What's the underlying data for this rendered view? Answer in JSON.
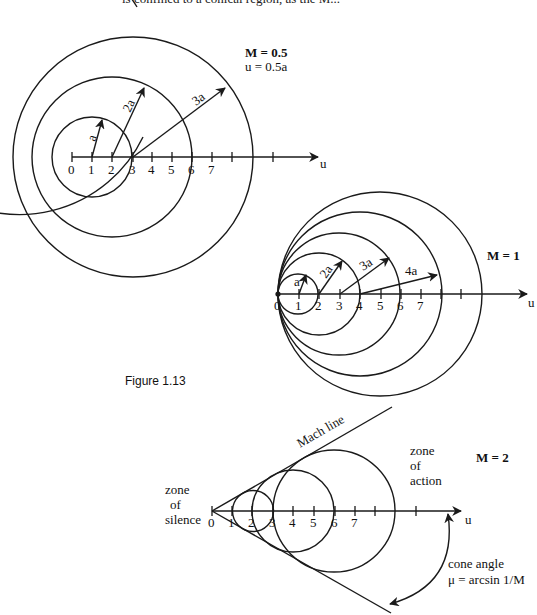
{
  "header": {
    "cut_text": "is confined to a conical region, as the M..."
  },
  "figure": {
    "caption": "Figure 1.13"
  },
  "diagrams": [
    {
      "id": "subsonic",
      "title": "M = 0.5",
      "subtitle": "u = 0.5a",
      "axis_label": "u",
      "tick_labels": [
        "0",
        "1",
        "2",
        "3",
        "4",
        "5",
        "6",
        "7"
      ],
      "radius_labels": [
        "a",
        "2a",
        "3a"
      ]
    },
    {
      "id": "sonic",
      "title": "M = 1",
      "axis_label": "u",
      "tick_labels": [
        "0",
        "1",
        "2",
        "3",
        "4",
        "5",
        "6",
        "7"
      ],
      "radius_labels": [
        "a",
        "2a",
        "3a",
        "4a"
      ]
    },
    {
      "id": "supersonic",
      "title": "M = 2",
      "axis_label": "u",
      "tick_labels": [
        "0",
        "1",
        "2",
        "3",
        "4",
        "5",
        "6",
        "7"
      ],
      "mach_line_label": "Mach line",
      "zone_action": [
        "zone",
        "of",
        "action"
      ],
      "zone_silence": [
        "zone",
        "of",
        "silence"
      ],
      "cone_angle_label": "cone angle",
      "cone_angle_formula": "μ = arcsin 1/M"
    }
  ]
}
